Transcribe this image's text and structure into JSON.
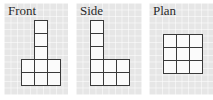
{
  "views": [
    {
      "title": "Front",
      "cells": [
        {
          "col": 1,
          "row": 0
        },
        {
          "col": 1,
          "row": 1
        },
        {
          "col": 1,
          "row": 2
        },
        {
          "col": 0,
          "row": 3
        },
        {
          "col": 1,
          "row": 3
        },
        {
          "col": 2,
          "row": 3
        },
        {
          "col": 0,
          "row": 4
        },
        {
          "col": 1,
          "row": 4
        },
        {
          "col": 2,
          "row": 4
        }
      ]
    },
    {
      "title": "Side",
      "cells": [
        {
          "col": 0,
          "row": 0
        },
        {
          "col": 0,
          "row": 1
        },
        {
          "col": 0,
          "row": 2
        },
        {
          "col": 0,
          "row": 3
        },
        {
          "col": 1,
          "row": 3
        },
        {
          "col": 2,
          "row": 3
        },
        {
          "col": 0,
          "row": 4
        },
        {
          "col": 1,
          "row": 4
        },
        {
          "col": 2,
          "row": 4
        }
      ]
    },
    {
      "title": "Plan",
      "cells": [
        {
          "col": 0,
          "row": 0
        },
        {
          "col": 1,
          "row": 0
        },
        {
          "col": 2,
          "row": 0
        },
        {
          "col": 0,
          "row": 1
        },
        {
          "col": 1,
          "row": 1
        },
        {
          "col": 2,
          "row": 1
        },
        {
          "col": 0,
          "row": 2
        },
        {
          "col": 1,
          "row": 2
        },
        {
          "col": 2,
          "row": 2
        }
      ]
    }
  ]
}
